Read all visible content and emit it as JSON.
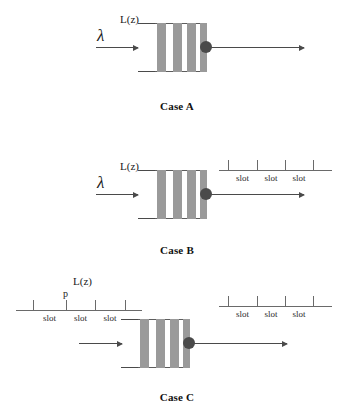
{
  "figure": {
    "width": 354,
    "height": 412,
    "background": "#ffffff",
    "line_color": "#4a4a4a",
    "bar_color": "#9a9a9a",
    "box_outline_color": "#5d5d5d",
    "server_dot_color": "#4a4a4a",
    "axis_color": "#6a6a6a",
    "text_color": "#1a1a1a"
  },
  "labels": {
    "lambda": "λ",
    "service_time": "L(z)",
    "probability": "p",
    "slot": "slot"
  },
  "cases": [
    {
      "id": "case-a",
      "caption": "Case A",
      "arrival_label": "λ",
      "service_label": "L(z)",
      "has_input_timeline": false,
      "has_output_timeline": false,
      "queue_bars": 4
    },
    {
      "id": "case-b",
      "caption": "Case B",
      "arrival_label": "λ",
      "service_label": "L(z)",
      "has_input_timeline": false,
      "has_output_timeline": true,
      "queue_bars": 4,
      "output_timeline": {
        "ticks": 4,
        "slot_labels": [
          "slot",
          "slot",
          "slot"
        ]
      }
    },
    {
      "id": "case-c",
      "caption": "Case C",
      "arrival_label": "",
      "service_label": "L(z)",
      "probability_label": "p",
      "has_input_timeline": true,
      "has_output_timeline": true,
      "queue_bars": 4,
      "input_timeline": {
        "ticks": 4,
        "slot_labels": [
          "slot",
          "slot",
          "slot"
        ]
      },
      "output_timeline": {
        "ticks": 4,
        "slot_labels": [
          "slot",
          "slot",
          "slot"
        ]
      }
    }
  ]
}
